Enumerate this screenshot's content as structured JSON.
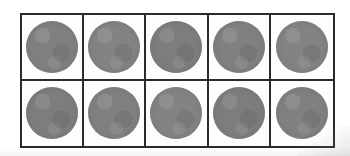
{
  "figure": {
    "name": "ten-frame",
    "type": "ten-frame-grid",
    "rows": 2,
    "columns": 5,
    "total_cells": 10,
    "filled_count": 10,
    "empty_count": 0,
    "background_color": "#ffffff",
    "frame_border_color": "#2b2b2b",
    "cell_fill_color": "#fdfdfd",
    "counter_color": "#808080"
  },
  "cells": [
    {
      "id": "cell-r1c1",
      "row": 1,
      "column": 1,
      "filled": true,
      "counter_label": "counter"
    },
    {
      "id": "cell-r1c2",
      "row": 1,
      "column": 2,
      "filled": true,
      "counter_label": "counter"
    },
    {
      "id": "cell-r1c3",
      "row": 1,
      "column": 3,
      "filled": true,
      "counter_label": "counter"
    },
    {
      "id": "cell-r1c4",
      "row": 1,
      "column": 4,
      "filled": true,
      "counter_label": "counter"
    },
    {
      "id": "cell-r1c5",
      "row": 1,
      "column": 5,
      "filled": true,
      "counter_label": "counter"
    },
    {
      "id": "cell-r2c1",
      "row": 2,
      "column": 1,
      "filled": true,
      "counter_label": "counter"
    },
    {
      "id": "cell-r2c2",
      "row": 2,
      "column": 2,
      "filled": true,
      "counter_label": "counter"
    },
    {
      "id": "cell-r2c3",
      "row": 2,
      "column": 3,
      "filled": true,
      "counter_label": "counter"
    },
    {
      "id": "cell-r2c4",
      "row": 2,
      "column": 4,
      "filled": true,
      "counter_label": "counter"
    },
    {
      "id": "cell-r2c5",
      "row": 2,
      "column": 5,
      "filled": true,
      "counter_label": "counter"
    }
  ],
  "labels": {
    "empty_text": ""
  }
}
